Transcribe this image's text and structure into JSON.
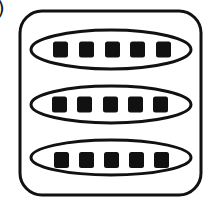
{
  "figure": {
    "label_fragment": ")",
    "colors": {
      "stroke": "#111111",
      "fill": "#111111",
      "background": "#ffffff"
    },
    "container": {
      "shape": "rounded-rectangle",
      "x": 20,
      "y": 11,
      "width": 181,
      "height": 184,
      "rx": 22,
      "stroke_width": 3
    },
    "groups": [
      {
        "name": "group-1",
        "ellipse": {
          "cx": 111,
          "cy": 49.5,
          "rx": 80,
          "ry": 19.5
        },
        "items": [
          {
            "x": 53,
            "y": 41.5,
            "w": 15,
            "h": 16
          },
          {
            "x": 79,
            "y": 41.5,
            "w": 15,
            "h": 16
          },
          {
            "x": 105,
            "y": 41.5,
            "w": 15,
            "h": 16
          },
          {
            "x": 130,
            "y": 41.5,
            "w": 15,
            "h": 16
          },
          {
            "x": 156,
            "y": 41.5,
            "w": 15,
            "h": 16
          }
        ]
      },
      {
        "name": "group-2",
        "ellipse": {
          "cx": 111,
          "cy": 104.5,
          "rx": 80,
          "ry": 18.5
        },
        "items": [
          {
            "x": 52,
            "y": 96.5,
            "w": 15,
            "h": 16
          },
          {
            "x": 77,
            "y": 96.5,
            "w": 15,
            "h": 16
          },
          {
            "x": 103,
            "y": 96.5,
            "w": 15,
            "h": 16
          },
          {
            "x": 128,
            "y": 96.5,
            "w": 15,
            "h": 16
          },
          {
            "x": 153,
            "y": 96.5,
            "w": 15,
            "h": 16
          }
        ]
      },
      {
        "name": "group-3",
        "ellipse": {
          "cx": 111,
          "cy": 157.5,
          "rx": 80,
          "ry": 17.5
        },
        "items": [
          {
            "x": 54,
            "y": 152,
            "w": 15,
            "h": 16
          },
          {
            "x": 79,
            "y": 152,
            "w": 15,
            "h": 16
          },
          {
            "x": 104,
            "y": 152,
            "w": 15,
            "h": 16
          },
          {
            "x": 129,
            "y": 152,
            "w": 15,
            "h": 16
          },
          {
            "x": 154,
            "y": 152,
            "w": 15,
            "h": 16
          }
        ]
      }
    ]
  }
}
